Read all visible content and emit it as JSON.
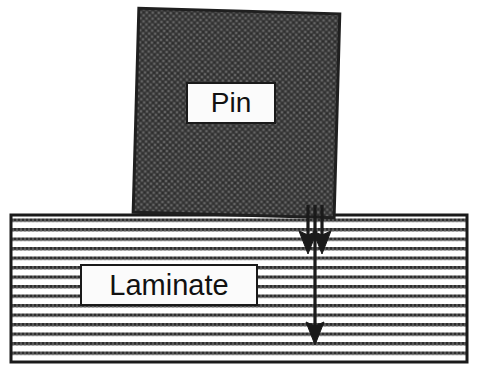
{
  "figure": {
    "type": "technical-diagram",
    "width": 478,
    "height": 381,
    "background_color": "#ffffff"
  },
  "pin": {
    "label": "Pin",
    "shape": "square",
    "fill_style": "cross-hatch-texture",
    "fill_color": "#5f5f5f",
    "stroke_color": "#1a1a1a",
    "rotation_degrees": 1.5,
    "bounds": {
      "x": 135,
      "y": 10,
      "width": 203,
      "height": 205
    }
  },
  "laminate": {
    "label": "Laminate",
    "shape": "rectangle",
    "fill_style": "horizontal-ply-lines",
    "line_color": "#2b2b2b",
    "line_spacing": 9.5,
    "stroke_color": "#1a1a1a",
    "bounds": {
      "x": 10,
      "y": 214,
      "width": 458,
      "height": 149
    }
  },
  "arrows": [
    {
      "name": "short-arrow-left",
      "direction": "down",
      "x": 308,
      "y_start": 205,
      "y_end": 250,
      "color": "#1a1a1a"
    },
    {
      "name": "short-arrow-right",
      "direction": "down",
      "x": 322,
      "y_start": 205,
      "y_end": 250,
      "color": "#1a1a1a"
    },
    {
      "name": "long-arrow-center",
      "direction": "down",
      "x": 315,
      "y_start": 205,
      "y_end": 341,
      "color": "#1a1a1a"
    }
  ],
  "colors": {
    "pin_fill": "#5f5f5f",
    "laminate_line": "#2b2b2b",
    "outline": "#1a1a1a",
    "label_background": "#fbfbfb",
    "page_background": "#ffffff"
  }
}
